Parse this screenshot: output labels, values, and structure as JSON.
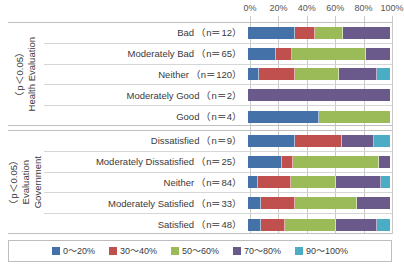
{
  "chart_data": {
    "type": "bar",
    "subtype": "stacked-horizontal-100pct",
    "title": "",
    "xlabel": "",
    "ylabel": "",
    "xlim": [
      0,
      100
    ],
    "grid": true,
    "legend_position": "bottom",
    "axis_ticks": [
      "0%",
      "20%",
      "40%",
      "60%",
      "80%",
      "100%"
    ],
    "axis_tick_values": [
      0,
      20,
      40,
      60,
      80,
      100
    ],
    "series": [
      {
        "name": "0～20%",
        "color": "#4472a8"
      },
      {
        "name": "30～40%",
        "color": "#c0504d"
      },
      {
        "name": "50～60%",
        "color": "#9bbb59"
      },
      {
        "name": "70～80%",
        "color": "#6a5a8c"
      },
      {
        "name": "90～100%",
        "color": "#4bacc6"
      }
    ],
    "groups": [
      {
        "id": "health",
        "axis_title_lines": [
          "Health Evaluation",
          "（p＜0.05）"
        ],
        "rows": [
          {
            "label": "Bad",
            "n_text": "（n＝12）",
            "n": 12,
            "values": [
              33,
              14,
              20,
              33,
              0
            ]
          },
          {
            "label": "Moderately Bad",
            "n_text": "（n＝65）",
            "n": 65,
            "values": [
              20,
              11,
              52,
              17,
              0
            ]
          },
          {
            "label": "Neither",
            "n_text": "（n＝120）",
            "n": 120,
            "values": [
              8,
              25,
              31,
              27,
              9
            ]
          },
          {
            "label": "Moderately Good",
            "n_text": "（n＝2）",
            "n": 2,
            "values": [
              0,
              0,
              0,
              100,
              0
            ]
          },
          {
            "label": "Good",
            "n_text": "（n＝4）",
            "n": 4,
            "values": [
              50,
              0,
              50,
              0,
              0
            ]
          }
        ]
      },
      {
        "id": "government",
        "axis_title_lines": [
          "Government",
          "Evaluation",
          "（p＜0.05）"
        ],
        "rows": [
          {
            "label": "Dissatisfied",
            "n_text": "（n＝9）",
            "n": 9,
            "values": [
              33,
              33,
              0,
              23,
              11
            ]
          },
          {
            "label": "Moderately Dissatisfied",
            "n_text": "（n＝25）",
            "n": 25,
            "values": [
              24,
              8,
              60,
              8,
              0
            ]
          },
          {
            "label": "Neither",
            "n_text": "（n＝84）",
            "n": 84,
            "values": [
              7,
              23,
              32,
              32,
              6
            ]
          },
          {
            "label": "Moderately Satisfied",
            "n_text": "（n＝33）",
            "n": 33,
            "values": [
              9,
              24,
              44,
              23,
              0
            ]
          },
          {
            "label": "Satisfied",
            "n_text": "（n＝48）",
            "n": 48,
            "values": [
              9,
              17,
              36,
              29,
              9
            ]
          }
        ]
      }
    ]
  }
}
